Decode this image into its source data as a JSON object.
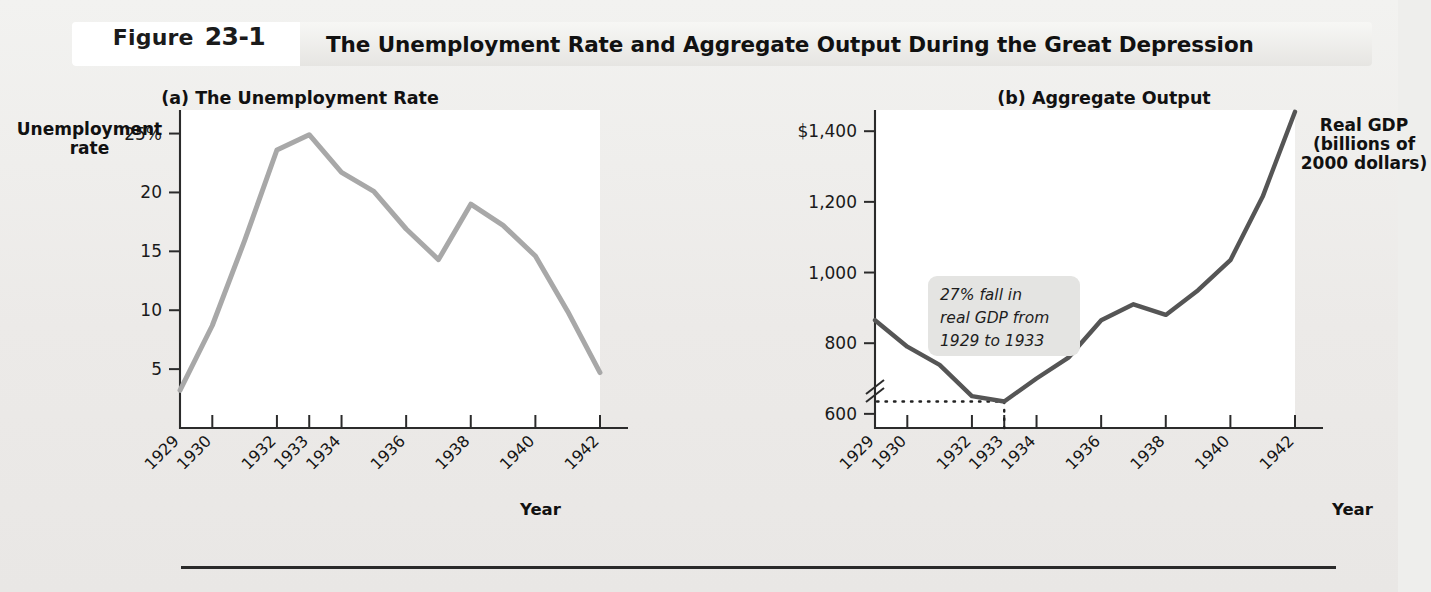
{
  "figure": {
    "tag_word": "Figure",
    "tag_number": "23-1",
    "title": "The Unemployment Rate and Aggregate Output During the Great Depression"
  },
  "panel_a": {
    "subtitle": "(a) The Unemployment Rate",
    "y_axis_title": "Unemployment\nrate",
    "x_axis_title": "Year"
  },
  "panel_b": {
    "subtitle": "(b) Aggregate Output",
    "y_axis_title": "Real GDP\n(billions of\n2000 dollars)",
    "x_axis_title": "Year",
    "annotation": "27% fall in\nreal GDP from\n1929 to 1933",
    "annotation_line1": "27% fall in",
    "annotation_line2": "real GDP from",
    "annotation_line3": "1929 to 1933"
  },
  "colors": {
    "unemployment_line": "#a8a8a8",
    "gdp_line": "#555555",
    "page_background": "#eeeeec",
    "plot_background": "#ffffff",
    "annotation_background": "#e4e4e2",
    "axis": "#2b2b2b"
  },
  "chart_data": [
    {
      "type": "line",
      "title": "(a) The Unemployment Rate",
      "xlabel": "Year",
      "ylabel": "Unemployment rate",
      "ylim": [
        0,
        27
      ],
      "ytick_labels": [
        "5",
        "10",
        "15",
        "20",
        "25%"
      ],
      "yticks": [
        5,
        10,
        15,
        20,
        25
      ],
      "xlim": [
        1929,
        1942
      ],
      "xtick_labels": [
        "1929",
        "1930",
        "1932",
        "1933",
        "1934",
        "1936",
        "1938",
        "1940",
        "1942"
      ],
      "xticks": [
        1929,
        1930,
        1932,
        1933,
        1934,
        1936,
        1938,
        1940,
        1942
      ],
      "grid": false,
      "legend": "none",
      "x": [
        1929,
        1930,
        1931,
        1932,
        1933,
        1934,
        1935,
        1936,
        1937,
        1938,
        1939,
        1940,
        1941,
        1942
      ],
      "values": [
        3.2,
        8.7,
        15.9,
        23.6,
        24.9,
        21.7,
        20.1,
        16.9,
        14.3,
        19.0,
        17.2,
        14.6,
        9.9,
        4.7
      ],
      "series": [
        {
          "name": "Unemployment rate",
          "color": "#a8a8a8",
          "values": [
            3.2,
            8.7,
            15.9,
            23.6,
            24.9,
            21.7,
            20.1,
            16.9,
            14.3,
            19.0,
            17.2,
            14.6,
            9.9,
            4.7
          ]
        }
      ]
    },
    {
      "type": "line",
      "title": "(b) Aggregate Output",
      "xlabel": "Year",
      "ylabel": "Real GDP (billions of 2000 dollars)",
      "ylim": [
        560,
        1460
      ],
      "axis_break": true,
      "ytick_labels": [
        "600",
        "800",
        "1,000",
        "1,200",
        "$1,400"
      ],
      "yticks": [
        600,
        800,
        1000,
        1200,
        1400
      ],
      "xlim": [
        1929,
        1942
      ],
      "xtick_labels": [
        "1929",
        "1930",
        "1932",
        "1933",
        "1934",
        "1936",
        "1938",
        "1940",
        "1942"
      ],
      "xticks": [
        1929,
        1930,
        1932,
        1933,
        1934,
        1936,
        1938,
        1940,
        1942
      ],
      "grid": false,
      "legend": "none",
      "reference_line": 635,
      "reference_line_label": "1933 trough level",
      "x": [
        1929,
        1930,
        1931,
        1932,
        1933,
        1934,
        1935,
        1936,
        1937,
        1938,
        1939,
        1940,
        1941,
        1942
      ],
      "values": [
        865,
        790,
        739,
        650,
        635,
        700,
        760,
        865,
        910,
        880,
        950,
        1035,
        1215,
        1455
      ],
      "series": [
        {
          "name": "Real GDP",
          "color": "#555555",
          "values": [
            865,
            790,
            739,
            650,
            635,
            700,
            760,
            865,
            910,
            880,
            950,
            1035,
            1215,
            1455
          ]
        }
      ]
    }
  ]
}
